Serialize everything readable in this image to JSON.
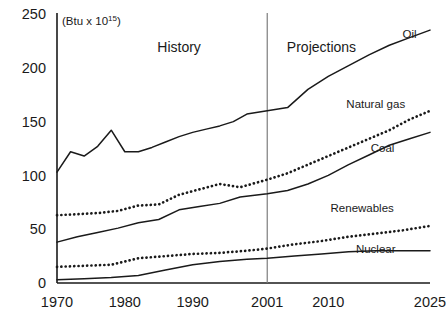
{
  "chart_data": {
    "type": "line",
    "title": "",
    "unit_note": "(Btu x 10",
    "unit_exponent": "15",
    "unit_note_close": ")",
    "xlabel": "",
    "ylabel": "",
    "xlim": [
      1970,
      2025
    ],
    "ylim": [
      0,
      250
    ],
    "grid": false,
    "legend_position": "inline-right",
    "ytick_labels": [
      "250",
      "200",
      "150",
      "100",
      "50",
      "0"
    ],
    "ytick_values": [
      250,
      200,
      150,
      100,
      50,
      0
    ],
    "xtick_labels": [
      "1970",
      "1980",
      "1990",
      "2001",
      "2010",
      "2025"
    ],
    "xtick_values": [
      1970,
      1980,
      1990,
      2001,
      2010,
      2025
    ],
    "annotations": [
      {
        "text": "History",
        "x": 1988,
        "y": 215
      },
      {
        "text": "Projections",
        "x": 2009,
        "y": 215
      }
    ],
    "divider": {
      "x": 2001,
      "label_left": "History",
      "label_right": "Projections"
    },
    "series": [
      {
        "name": "Oil",
        "style": "solid",
        "label_x": 2022,
        "label_y": 228,
        "x": [
          1970,
          1972,
          1974,
          1976,
          1978,
          1980,
          1982,
          1984,
          1986,
          1988,
          1990,
          1992,
          1994,
          1996,
          1998,
          2001,
          2004,
          2007,
          2010,
          2013,
          2016,
          2019,
          2022,
          2025
        ],
        "values": [
          103,
          122,
          118,
          127,
          142,
          122,
          122,
          126,
          131,
          136,
          140,
          143,
          146,
          150,
          157,
          160,
          163,
          180,
          192,
          202,
          212,
          221,
          228,
          235
        ]
      },
      {
        "name": "Natural gas",
        "style": "solid",
        "label_x": 2017,
        "label_y": 163,
        "x": [
          1970,
          1973,
          1976,
          1979,
          1982,
          1985,
          1988,
          1991,
          1994,
          1997,
          2001,
          2004,
          2007,
          2010,
          2013,
          2016,
          2019,
          2022,
          2025
        ],
        "values": [
          38,
          43,
          47,
          51,
          56,
          59,
          68,
          71,
          74,
          80,
          83,
          86,
          92,
          100,
          110,
          119,
          128,
          134,
          140
        ]
      },
      {
        "name": "Coal",
        "style": "dotted",
        "label_x": 2018,
        "label_y": 122,
        "x": [
          1970,
          1973,
          1976,
          1979,
          1982,
          1985,
          1988,
          1991,
          1994,
          1997,
          2001,
          2004,
          2007,
          2010,
          2013,
          2016,
          2019,
          2022,
          2025
        ],
        "values": [
          63,
          64,
          65,
          67,
          72,
          73,
          82,
          87,
          92,
          89,
          96,
          102,
          110,
          118,
          126,
          134,
          142,
          152,
          160
        ]
      },
      {
        "name": "Renewables",
        "style": "dotted",
        "label_x": 2015,
        "label_y": 66,
        "x": [
          1970,
          1974,
          1978,
          1982,
          1986,
          1990,
          1994,
          1998,
          2001,
          2005,
          2009,
          2013,
          2017,
          2021,
          2025
        ],
        "values": [
          15,
          16,
          17,
          23,
          25,
          27,
          28,
          30,
          32,
          36,
          39,
          43,
          46,
          49,
          53
        ]
      },
      {
        "name": "Nuclear",
        "style": "solid",
        "label_x": 2017,
        "label_y": 28,
        "x": [
          1970,
          1974,
          1978,
          1982,
          1986,
          1990,
          1994,
          1998,
          2001,
          2005,
          2009,
          2013,
          2017,
          2021,
          2025
        ],
        "values": [
          3,
          4,
          5,
          7,
          12,
          17,
          20,
          22,
          23,
          25,
          27,
          29,
          30,
          30,
          30
        ]
      }
    ]
  }
}
